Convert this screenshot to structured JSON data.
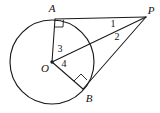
{
  "figure": {
    "background_color": "#ffffff",
    "stroke_color": "#1a1a1a",
    "width": 160,
    "height": 113
  },
  "points": {
    "A": {
      "label": "A",
      "x": 55,
      "y": 19,
      "label_x": 52,
      "label_y": 9
    },
    "B": {
      "label": "B",
      "x": 83,
      "y": 89,
      "label_x": 89,
      "label_y": 99
    },
    "O": {
      "label": "O",
      "x": 52,
      "y": 62,
      "label_x": 45,
      "label_y": 69
    },
    "P": {
      "label": "P",
      "x": 146,
      "y": 17,
      "label_x": 151,
      "label_y": 11
    }
  },
  "angles": {
    "one": {
      "label": "1",
      "x": 113,
      "y": 25
    },
    "two": {
      "label": "2",
      "x": 117,
      "y": 38
    },
    "three": {
      "label": "3",
      "x": 60,
      "y": 50
    },
    "four": {
      "label": "4",
      "x": 64,
      "y": 65
    }
  },
  "circle": {
    "center_x": 52,
    "center_y": 62,
    "radius": 42
  },
  "segments": [
    {
      "name": "radius-OA",
      "from": "O",
      "to": "A"
    },
    {
      "name": "radius-OB",
      "from": "O",
      "to": "B"
    },
    {
      "name": "tangent-AP",
      "from": "A",
      "to": "P"
    },
    {
      "name": "tangent-BP",
      "from": "B",
      "to": "P"
    },
    {
      "name": "secant-OP",
      "from": "O",
      "to": "P"
    }
  ],
  "right_angle_marks": [
    {
      "name": "right-angle-at-A",
      "vertex": "A"
    },
    {
      "name": "right-angle-at-B",
      "vertex": "B"
    }
  ]
}
